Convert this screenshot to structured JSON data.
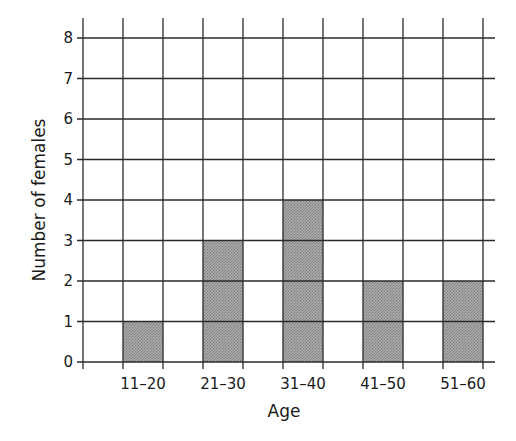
{
  "chart_data": {
    "type": "bar",
    "title": "",
    "categories": [
      "11–20",
      "21–30",
      "31–40",
      "41–50",
      "51–60"
    ],
    "values": [
      1,
      3,
      4,
      2,
      2
    ],
    "xlabel": "Age",
    "ylabel": "Number of females",
    "ylim": [
      0,
      8
    ],
    "yticks": [
      0,
      1,
      2,
      3,
      4,
      5,
      6,
      7,
      8
    ],
    "grid": true,
    "legend": null,
    "bar_color": "#9a9a9a",
    "grid_color": "#2a2a2a"
  }
}
